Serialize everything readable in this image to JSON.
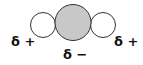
{
  "diagram": {
    "type": "linear polar molecule with partial charges",
    "atoms": [
      {
        "role": "left-atom",
        "fill": "#ffffff",
        "charge": "δ+"
      },
      {
        "role": "center-atom",
        "fill": "#c8c8c8",
        "charge": "δ−"
      },
      {
        "role": "right-atom",
        "fill": "#ffffff",
        "charge": "δ+"
      }
    ],
    "labels": {
      "left": "δ +",
      "center": "δ −",
      "right": "δ +"
    },
    "colors": {
      "outline": "#333333",
      "center_fill": "#c8c8c8",
      "side_fill": "#ffffff"
    }
  }
}
